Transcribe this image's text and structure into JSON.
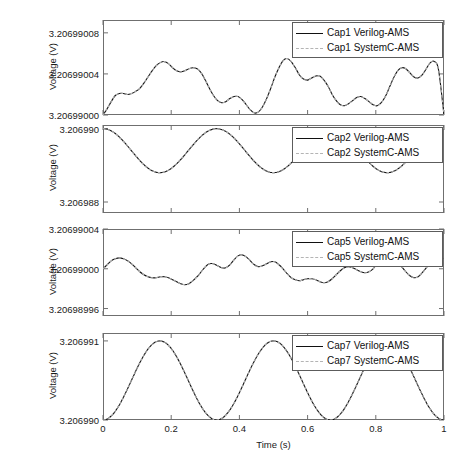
{
  "figure": {
    "title": "",
    "background": "#ffffff",
    "axis_color": "#6f6f6f",
    "text_color": "#1a1a1a",
    "series_colors": {
      "verilog_ams": "#111111",
      "systemc_ams": "#b4b4b4"
    },
    "xlabel": "Time (s)",
    "xticks": [
      "0",
      "0.2",
      "0.4",
      "0.6",
      "0.8",
      "1"
    ]
  },
  "chart_data": [
    {
      "type": "line",
      "panel": 1,
      "name": "Cap1",
      "title": "",
      "xlabel": "",
      "ylabel": "Voltage (V)",
      "xlim": [
        0,
        1
      ],
      "ylim": [
        3.20699,
        3.2069900925
      ],
      "xticks": [
        0,
        0.2,
        0.4,
        0.6,
        0.8,
        1
      ],
      "xticklabels": [
        "0",
        "0.2",
        "0.4",
        "0.6",
        "0.8",
        "1"
      ],
      "yticks": [
        3.20699,
        3.20699004,
        3.20699008
      ],
      "yticklabels": [
        "3.20699000",
        "3.20699004",
        "3.20699008"
      ],
      "grid": false,
      "legend_position": "upper right",
      "series": [
        {
          "name": "Cap1 Verilog-AMS",
          "style": "solid",
          "color": "#111111",
          "x": [
            0.0,
            0.012,
            0.024,
            0.036,
            0.048,
            0.06,
            0.072,
            0.084,
            0.096,
            0.108,
            0.12,
            0.132,
            0.144,
            0.156,
            0.168,
            0.18,
            0.192,
            0.204,
            0.216,
            0.228,
            0.24,
            0.252,
            0.264,
            0.276,
            0.288,
            0.3,
            0.312,
            0.324,
            0.336,
            0.348,
            0.36,
            0.372,
            0.384,
            0.396,
            0.408,
            0.42,
            0.432,
            0.444,
            0.456,
            0.468,
            0.48,
            0.492,
            0.504,
            0.516,
            0.528,
            0.54,
            0.552,
            0.564,
            0.576,
            0.588,
            0.6,
            0.612,
            0.624,
            0.636,
            0.648,
            0.66,
            0.672,
            0.684,
            0.696,
            0.708,
            0.72,
            0.732,
            0.744,
            0.756,
            0.768,
            0.78,
            0.792,
            0.804,
            0.816,
            0.828,
            0.84,
            0.852,
            0.864,
            0.876,
            0.888,
            0.9,
            0.912,
            0.924,
            0.936,
            0.948,
            0.96,
            0.972,
            0.984,
            1.0
          ],
          "y": [
            3.20699,
            3.206990006,
            3.206990013,
            3.206990019,
            3.206990021,
            3.206990021,
            3.20699002,
            3.206990021,
            3.206990023,
            3.206990026,
            3.206990031,
            3.206990037,
            3.206990043,
            3.206990048,
            3.206990051,
            3.206990052,
            3.20699005,
            3.206990046,
            3.206990043,
            3.206990042,
            3.206990043,
            3.206990045,
            3.206990046,
            3.206990045,
            3.206990041,
            3.206990034,
            3.206990026,
            3.206990019,
            3.206990014,
            3.206990012,
            3.206990013,
            3.206990016,
            3.206990018,
            3.206990018,
            3.206990015,
            3.20699001,
            3.206990005,
            3.206990002,
            3.206990003,
            3.206990008,
            3.206990016,
            3.206990026,
            3.206990037,
            3.206990046,
            3.206990053,
            3.206990055,
            3.206990052,
            3.206990046,
            3.206990039,
            3.206990035,
            3.206990034,
            3.206990036,
            3.206990038,
            3.206990038,
            3.206990034,
            3.206990028,
            3.20699002,
            3.206990014,
            3.20699001,
            3.206990009,
            3.206990011,
            3.206990014,
            3.206990017,
            3.206990018,
            3.206990016,
            3.206990013,
            3.20699001,
            3.206990009,
            3.206990012,
            3.206990018,
            3.206990027,
            3.206990036,
            3.206990043,
            3.206990046,
            3.206990045,
            3.206990041,
            3.206990037,
            3.206990036,
            3.206990039,
            3.206990045,
            3.206990051,
            3.206990052,
            3.206990044,
            3.20699
          ]
        },
        {
          "name": "Cap1 SystemC-AMS",
          "style": "dashed",
          "color": "#b4b4b4",
          "overlaps": true
        }
      ]
    },
    {
      "type": "line",
      "panel": 2,
      "name": "Cap2",
      "title": "",
      "xlabel": "",
      "ylabel": "Voltage (V)",
      "xlim": [
        0,
        1
      ],
      "ylim": [
        3.2069877,
        3.2069901
      ],
      "xticks": [
        0,
        0.2,
        0.4,
        0.6,
        0.8,
        1
      ],
      "xticklabels": [
        "0",
        "0.2",
        "0.4",
        "0.6",
        "0.8",
        "1"
      ],
      "yticks": [
        3.206988,
        3.20699
      ],
      "yticklabels": [
        "3.206988",
        "3.206990"
      ],
      "grid": false,
      "legend_position": "upper right",
      "series": [
        {
          "name": "Cap2 Verilog-AMS",
          "style": "solid",
          "color": "#111111",
          "waveform": "cosine",
          "mean": 3.2069894,
          "amplitude": 6e-07,
          "cycles": 3,
          "phase_deg": 0
        },
        {
          "name": "Cap2 SystemC-AMS",
          "style": "dashed",
          "color": "#b4b4b4",
          "overlaps": true
        }
      ]
    },
    {
      "type": "line",
      "panel": 3,
      "name": "Cap5",
      "title": "",
      "xlabel": "",
      "ylabel": "Voltage (V)",
      "xlim": [
        0,
        1
      ],
      "ylim": [
        3.2069899525,
        3.20699004
      ],
      "xticks": [
        0,
        0.2,
        0.4,
        0.6,
        0.8,
        1
      ],
      "xticklabels": [
        "0",
        "0.2",
        "0.4",
        "0.6",
        "0.8",
        "1"
      ],
      "yticks": [
        3.20698996,
        3.20699,
        3.20699004
      ],
      "yticklabels": [
        "3.20698996",
        "3.20699000",
        "3.20699004"
      ],
      "grid": false,
      "legend_position": "upper right",
      "series": [
        {
          "name": "Cap5 Verilog-AMS",
          "style": "solid",
          "color": "#111111",
          "x": [
            0.0,
            0.012,
            0.024,
            0.036,
            0.048,
            0.06,
            0.072,
            0.084,
            0.096,
            0.108,
            0.12,
            0.132,
            0.144,
            0.156,
            0.168,
            0.18,
            0.192,
            0.204,
            0.216,
            0.228,
            0.24,
            0.252,
            0.264,
            0.276,
            0.288,
            0.3,
            0.312,
            0.324,
            0.336,
            0.348,
            0.36,
            0.372,
            0.384,
            0.396,
            0.408,
            0.42,
            0.432,
            0.444,
            0.456,
            0.468,
            0.48,
            0.492,
            0.504,
            0.516,
            0.528,
            0.54,
            0.552,
            0.564,
            0.576,
            0.588,
            0.6,
            0.612,
            0.624,
            0.636,
            0.648,
            0.66,
            0.672,
            0.684,
            0.696,
            0.708,
            0.72,
            0.732,
            0.744,
            0.756,
            0.768,
            0.78,
            0.792,
            0.804,
            0.816,
            0.828,
            0.84,
            0.852,
            0.864,
            0.876,
            0.888,
            0.9,
            0.912,
            0.924,
            0.936,
            0.948,
            0.96,
            0.972,
            0.984,
            1.0
          ],
          "y": [
            3.20699,
            3.206990004,
            3.206990008,
            3.20699001,
            3.206990011,
            3.20699001,
            3.206990008,
            3.206990005,
            3.206990001,
            3.206989997,
            3.206989994,
            3.206989992,
            3.206989991,
            3.206989991,
            3.206989992,
            3.206989992,
            3.206989991,
            3.206989989,
            3.206989987,
            3.206989985,
            3.206989984,
            3.206989985,
            3.206989988,
            3.206989992,
            3.206989997,
            3.206990002,
            3.206990005,
            3.206990005,
            3.206990003,
            3.206990001,
            3.206990001,
            3.206990004,
            3.206990009,
            3.206990013,
            3.206990014,
            3.206990012,
            3.206990008,
            3.206990004,
            3.206990002,
            3.206990003,
            3.206990005,
            3.206990007,
            3.206990007,
            3.206990004,
            3.20699,
            3.206989995,
            3.206989991,
            3.206989989,
            3.206989988,
            3.206989989,
            3.20698999,
            3.20698999,
            3.206989989,
            3.206989987,
            3.206989986,
            3.206989987,
            3.20698999,
            3.206989994,
            3.206989998,
            3.206990001,
            3.206990002,
            3.206990001,
            3.206989999,
            3.206989997,
            3.206989996,
            3.206989997,
            3.20699,
            3.206990005,
            3.20699001,
            3.206990013,
            3.206990013,
            3.206990011,
            3.206990007,
            3.206990002,
            3.206989997,
            3.206989993,
            3.206989991,
            3.206989992,
            3.206989996,
            3.206990001,
            3.206990006,
            3.20699001,
            3.206990012,
            3.206990011
          ]
        },
        {
          "name": "Cap5 SystemC-AMS",
          "style": "dashed",
          "color": "#b4b4b4",
          "overlaps": true
        }
      ]
    },
    {
      "type": "line",
      "panel": 4,
      "name": "Cap7",
      "title": "",
      "xlabel": "Time (s)",
      "ylabel": "Voltage (V)",
      "xlim": [
        0,
        1
      ],
      "ylim": [
        3.20699,
        3.2069911
      ],
      "xticks": [
        0,
        0.2,
        0.4,
        0.6,
        0.8,
        1
      ],
      "xticklabels": [
        "0",
        "0.2",
        "0.4",
        "0.6",
        "0.8",
        "1"
      ],
      "yticks": [
        3.20699,
        3.206991
      ],
      "yticklabels": [
        "3.206990",
        "3.206991"
      ],
      "grid": false,
      "legend_position": "upper right",
      "series": [
        {
          "name": "Cap7 Verilog-AMS",
          "style": "solid",
          "color": "#111111",
          "waveform": "raised-sine",
          "min": 3.20699,
          "max": 3.206991,
          "cycles": 3,
          "phase_deg": -90
        },
        {
          "name": "Cap7 SystemC-AMS",
          "style": "dashed",
          "color": "#b4b4b4",
          "overlaps": true
        }
      ]
    }
  ]
}
